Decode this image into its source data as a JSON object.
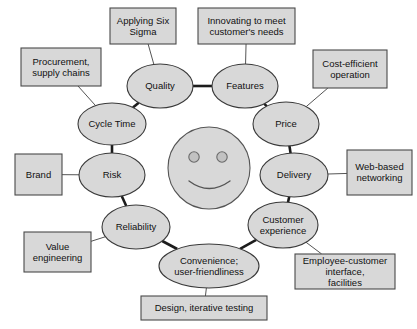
{
  "diagram": {
    "colors": {
      "shape_fill": "#d8d8d8",
      "shape_stroke": "#3a3a3a",
      "thick_link": "#1c1c1c",
      "thin_link": "#555555",
      "background": "#ffffff",
      "text": "#111111"
    },
    "center": {
      "name": "smiley-face",
      "description": "smiling face"
    },
    "nodes": [
      {
        "id": "quality",
        "label": "Quality",
        "cx": 160,
        "cy": 86,
        "rx": 33,
        "ry": 22
      },
      {
        "id": "features",
        "label": "Features",
        "cx": 245,
        "cy": 86,
        "rx": 33,
        "ry": 22
      },
      {
        "id": "cycle",
        "label": "Cycle Time",
        "cx": 112,
        "cy": 124,
        "rx": 34,
        "ry": 21
      },
      {
        "id": "price",
        "label": "Price",
        "cx": 286,
        "cy": 124,
        "rx": 33,
        "ry": 22
      },
      {
        "id": "risk",
        "label": "Risk",
        "cx": 112,
        "cy": 175,
        "rx": 33,
        "ry": 22
      },
      {
        "id": "delivery",
        "label": "Delivery",
        "cx": 294,
        "cy": 175,
        "rx": 34,
        "ry": 22
      },
      {
        "id": "relia",
        "label": "Reliability",
        "cx": 136,
        "cy": 227,
        "rx": 34,
        "ry": 22
      },
      {
        "id": "custexp",
        "label": "Customer experience",
        "cx": 283,
        "cy": 225,
        "rx": 35,
        "ry": 23
      },
      {
        "id": "conv",
        "label": "Convenience; user-friendliness",
        "cx": 209,
        "cy": 266,
        "rx": 50,
        "ry": 22
      }
    ],
    "boxes": [
      {
        "id": "six-sigma",
        "label": "Applying Six Sigma",
        "x": 110,
        "y": 8,
        "w": 66,
        "h": 36
      },
      {
        "id": "innovating",
        "label": "Innovating to meet customer's needs",
        "x": 198,
        "y": 8,
        "w": 97,
        "h": 36
      },
      {
        "id": "procure",
        "label": "Procurement, supply chains",
        "x": 21,
        "y": 48,
        "w": 80,
        "h": 38
      },
      {
        "id": "cost",
        "label": "Cost-efficient operation",
        "x": 313,
        "y": 50,
        "w": 74,
        "h": 38
      },
      {
        "id": "brand",
        "label": "Brand",
        "x": 15,
        "y": 154,
        "w": 47,
        "h": 41
      },
      {
        "id": "webbased",
        "label": "Web-based networking",
        "x": 347,
        "y": 150,
        "w": 65,
        "h": 45
      },
      {
        "id": "value",
        "label": "Value engineering",
        "x": 24,
        "y": 232,
        "w": 67,
        "h": 40
      },
      {
        "id": "employee",
        "label": "Employee-customer interface, facilities",
        "x": 295,
        "y": 254,
        "w": 100,
        "h": 35
      },
      {
        "id": "design",
        "label": "Design, iterative testing",
        "x": 141,
        "y": 296,
        "w": 126,
        "h": 24
      }
    ],
    "links_thick": [
      {
        "from": "quality",
        "to": "features"
      },
      {
        "from": "quality",
        "to": "cycle"
      },
      {
        "from": "features",
        "to": "price"
      },
      {
        "from": "cycle",
        "to": "risk"
      },
      {
        "from": "price",
        "to": "delivery"
      },
      {
        "from": "risk",
        "to": "relia"
      },
      {
        "from": "delivery",
        "to": "custexp"
      },
      {
        "from": "relia",
        "to": "conv"
      },
      {
        "from": "custexp",
        "to": "conv"
      }
    ],
    "links_thin": [
      {
        "from": "six-sigma",
        "to": "quality"
      },
      {
        "from": "innovating",
        "to": "features"
      },
      {
        "from": "procure",
        "to": "cycle"
      },
      {
        "from": "cost",
        "to": "price"
      },
      {
        "from": "brand",
        "to": "risk"
      },
      {
        "from": "webbased",
        "to": "delivery"
      },
      {
        "from": "value",
        "to": "relia"
      },
      {
        "from": "employee",
        "to": "custexp"
      },
      {
        "from": "design",
        "to": "conv"
      }
    ]
  }
}
